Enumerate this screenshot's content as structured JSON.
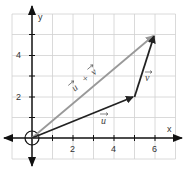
{
  "diagram": {
    "type": "vector-addition",
    "axes": {
      "x_label": "x",
      "y_label": "y",
      "x_ticks": [
        "2",
        "4",
        "6"
      ],
      "y_ticks": [
        "2",
        "4"
      ]
    },
    "vectors": [
      {
        "name": "u",
        "label": "u",
        "from": [
          0,
          0
        ],
        "to": [
          5,
          2
        ],
        "color": "#222222"
      },
      {
        "name": "v",
        "label": "v",
        "from": [
          5,
          2
        ],
        "to": [
          6,
          5
        ],
        "color": "#222222"
      },
      {
        "name": "u_plus_v",
        "label": "u + v",
        "from": [
          0,
          0
        ],
        "to": [
          6,
          5
        ],
        "color": "#999999"
      }
    ],
    "labels": {
      "u": "u",
      "v": "v",
      "sum_u": "u",
      "sum_plus": "+",
      "sum_v": "v"
    },
    "colors": {
      "grid": "#d0d0d0",
      "axis": "#111111",
      "sum_vector": "#999999",
      "vector": "#222222"
    }
  }
}
